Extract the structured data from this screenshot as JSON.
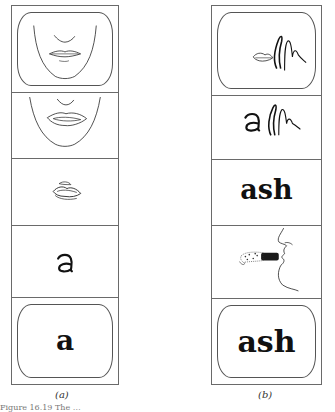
{
  "figure": {
    "panels": [
      {
        "id": "a",
        "label": "(a)",
        "frames": [
          {
            "content": "face-lips-closed-drawing",
            "tv_screen": true
          },
          {
            "content": "lips-parted-drawing",
            "tv_screen": false
          },
          {
            "content": "lips-scribble-drawing",
            "tv_screen": false
          },
          {
            "content": "handwritten-letter",
            "text": "a",
            "tv_screen": false
          },
          {
            "content": "printed-letter",
            "text": "a",
            "tv_screen": true
          }
        ]
      },
      {
        "id": "b",
        "label": "(b)",
        "frames": [
          {
            "content": "lips-and-hand-scribble-drawing",
            "tv_screen": true
          },
          {
            "content": "handwritten-letter-with-scribble",
            "text": "a",
            "tv_screen": false
          },
          {
            "content": "printed-word",
            "text": "ash",
            "tv_screen": false
          },
          {
            "content": "profile-face-breath-drawing",
            "tv_screen": false
          },
          {
            "content": "printed-word",
            "text": "ash",
            "tv_screen": true
          }
        ]
      }
    ],
    "caption": "Figure 16.19  The …"
  }
}
